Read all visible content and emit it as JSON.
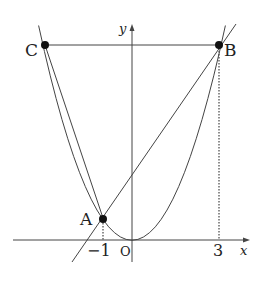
{
  "diagram": {
    "type": "coordinate-geometry",
    "axes": {
      "x_label": "x",
      "y_label": "y",
      "origin_label": "O"
    },
    "ticks": {
      "x_neg1": "−1",
      "x_3": "3"
    },
    "points": {
      "A": {
        "label": "A",
        "x": -1,
        "y": 1
      },
      "B": {
        "label": "B",
        "x": 3,
        "y": 9
      },
      "C": {
        "label": "C",
        "x": -3,
        "y": 9
      }
    },
    "curves": [
      "parabola y = x^2",
      "line AB",
      "segment BC",
      "segment CA"
    ],
    "colors": {
      "stroke": "#333333",
      "point": "#111111"
    }
  }
}
